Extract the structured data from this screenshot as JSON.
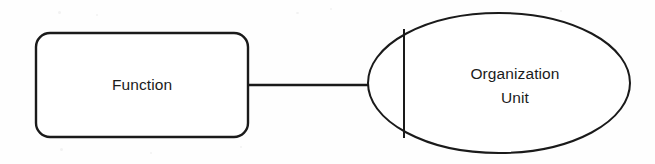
{
  "diagram": {
    "type": "entity-relationship-fragment",
    "canvas": {
      "width": 655,
      "height": 164,
      "background": "#fefefe"
    },
    "stroke_color": "#1a1a1a",
    "text_color": "#1b1b1b",
    "nodes": [
      {
        "id": "function",
        "shape": "rounded-rectangle",
        "label": "Function",
        "x": 36,
        "y": 33,
        "width": 212,
        "height": 104,
        "corner_radius": 14,
        "stroke_width": 2.4,
        "label_x": 142,
        "label_y": 86
      },
      {
        "id": "organization-unit",
        "shape": "ellipse",
        "label_line1": "Organization",
        "label_line2": "Unit",
        "cx": 499,
        "cy": 83,
        "rx": 131,
        "ry": 70,
        "stroke_width": 2.0,
        "label_x": 515,
        "label_line1_y": 75,
        "label_line2_y": 99,
        "divider": {
          "name": "ellipse-vertical-chord",
          "x": 404,
          "y1": 29,
          "y2": 138,
          "stroke_width": 2.0
        }
      }
    ],
    "edges": [
      {
        "id": "function-to-organization-unit",
        "from": "function",
        "to": "organization-unit",
        "x1": 247,
        "y1": 85,
        "x2": 370,
        "y2": 85,
        "stroke_width": 2.6,
        "label": ""
      }
    ]
  }
}
